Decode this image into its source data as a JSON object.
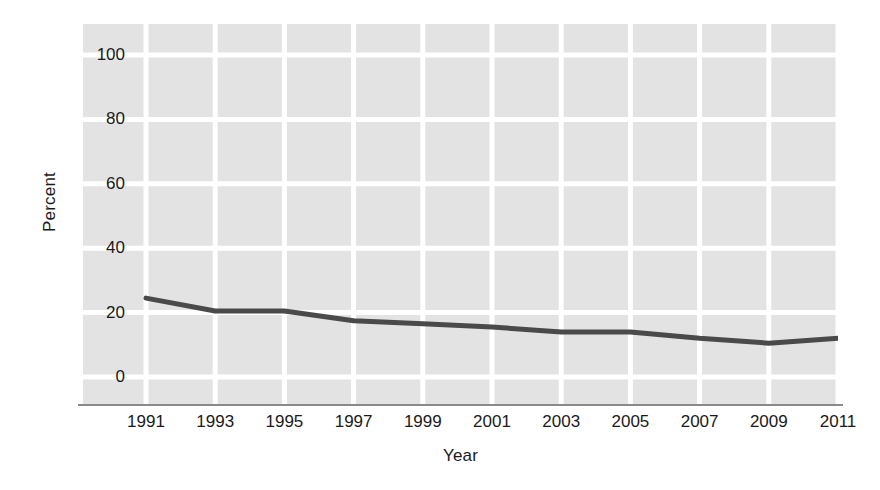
{
  "figure": {
    "background_color": "#ffffff",
    "plot_background_color": "#e3e3e3",
    "gridline_color": "#ffffff",
    "line_color": "#4a4a4a",
    "axis_color": "#8a8a8a",
    "text_color": "#1a1a1a"
  },
  "axes": {
    "ylabel": "Percent",
    "xlabel": "Year",
    "yticks": [
      "0",
      "20",
      "40",
      "60",
      "80",
      "100"
    ],
    "ytick_values": [
      0,
      20,
      40,
      60,
      80,
      100
    ],
    "xticks": [
      "1991",
      "1993",
      "1995",
      "1997",
      "1999",
      "2001",
      "2003",
      "2005",
      "2007",
      "2009",
      "2011"
    ]
  },
  "chart_data": {
    "type": "line",
    "title": "",
    "subtitle": "",
    "xlabel": "Year",
    "ylabel": "Percent",
    "x": [
      1991,
      1993,
      1995,
      1997,
      1999,
      2001,
      2003,
      2005,
      2007,
      2009,
      2011
    ],
    "values": [
      24.5,
      20.5,
      20.5,
      17.5,
      16.5,
      15.5,
      14.0,
      14.0,
      12.0,
      10.5,
      12.0
    ],
    "categories": [
      "1991",
      "1993",
      "1995",
      "1997",
      "1999",
      "2001",
      "2003",
      "2005",
      "2007",
      "2009",
      "2011"
    ],
    "series": [
      {
        "name": "Percent",
        "values": [
          24.5,
          20.5,
          20.5,
          17.5,
          16.5,
          15.5,
          14.0,
          14.0,
          12.0,
          10.5,
          12.0
        ]
      }
    ],
    "xlim": [
      1991,
      2011
    ],
    "ylim": [
      0,
      100
    ],
    "ytick_interval": 20,
    "xtick_interval": 2,
    "grid": true,
    "grid_axis": "both",
    "legend": false,
    "legend_position": "none",
    "markers": false,
    "line_width": 5
  }
}
